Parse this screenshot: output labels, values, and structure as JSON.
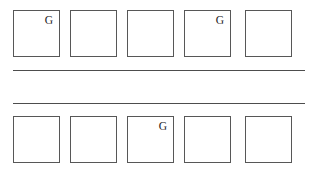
{
  "canvas": {
    "width": 322,
    "height": 180,
    "background": "#ffffff",
    "ink_color": "#1c1c1c",
    "border_color": "#575757",
    "rule_color": "#4d4d4d"
  },
  "rows": [
    {
      "name": "top-row",
      "cells": [
        {
          "label": "G"
        },
        {
          "label": ""
        },
        {
          "label": ""
        },
        {
          "label": "G"
        },
        {
          "label": ""
        }
      ]
    },
    {
      "name": "bottom-row",
      "cells": [
        {
          "label": ""
        },
        {
          "label": ""
        },
        {
          "label": "G"
        },
        {
          "label": ""
        },
        {
          "label": ""
        }
      ]
    }
  ],
  "rules": [
    {
      "name": "upper-rule"
    },
    {
      "name": "lower-rule"
    }
  ]
}
